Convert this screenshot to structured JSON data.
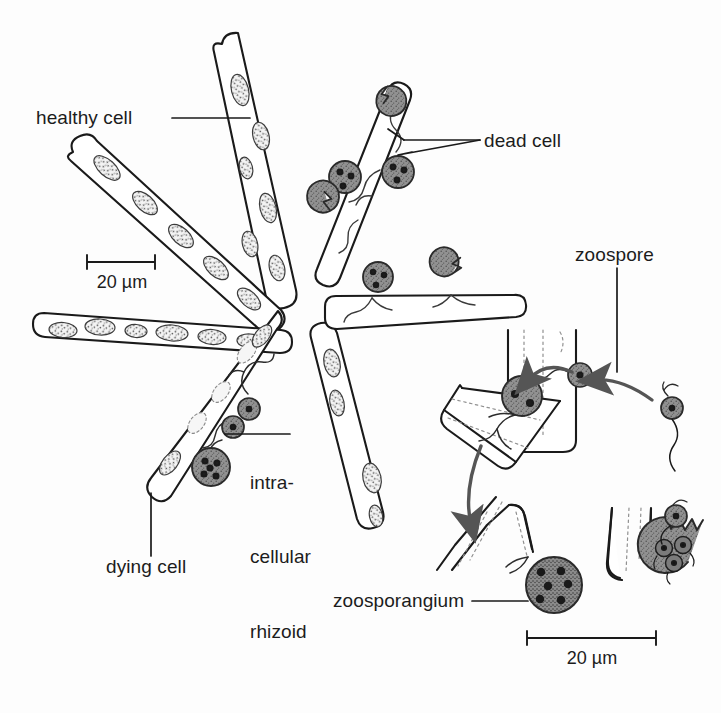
{
  "figure": {
    "background_color": "#fdfdfd",
    "ink_color": "#1a1a1a",
    "sporangium_fill": "#8f8f8f",
    "sporangium_stroke": "#2a2a2a",
    "chloroplast_fill": "#f2f2f2",
    "stipple_color": "#4a4a4a"
  },
  "labels": {
    "healthy_cell": "healthy cell",
    "dead_cell": "dead cell",
    "zoospore": "zoospore",
    "zoosporangium": "zoosporangium",
    "dying_cell": "dying cell",
    "intracellular_rhizoid_line1": "intra-",
    "intracellular_rhizoid_line2": "cellular",
    "intracellular_rhizoid_line3": "rhizoid"
  },
  "scale_bars": [
    {
      "id": "scale-bar-left",
      "value": "20 µm",
      "length_px": 68
    },
    {
      "id": "scale-bar-right",
      "value": "20 µm",
      "length_px": 129
    }
  ]
}
